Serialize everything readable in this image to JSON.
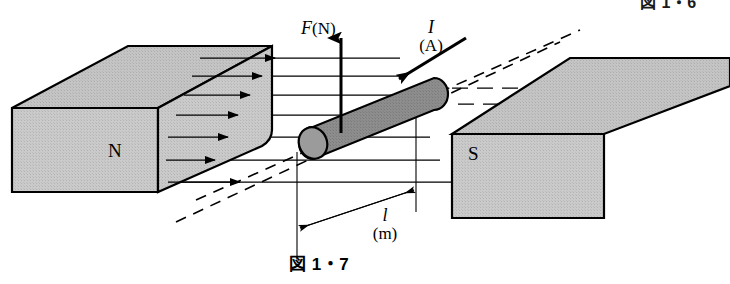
{
  "figure": {
    "caption": "図 1・7",
    "caption_above": "図 1・6",
    "background_color": "#ffffff",
    "ink_color": "#000000",
    "magnet_fill": "#c9c9c9",
    "magnet_top_fill": "#c4c4c4",
    "rod_fill": "#8a8a8a",
    "rod_cap_fill": "#9a9a9a"
  },
  "labels": {
    "north_pole": "N",
    "south_pole": "S",
    "force_symbol": "F",
    "force_unit": "(N)",
    "current_symbol": "I",
    "current_unit": "(A)",
    "length_symbol": "l",
    "length_unit": "(m)"
  },
  "elements": {
    "north_block_name": "north-pole-magnet",
    "south_block_name": "south-pole-magnet",
    "rod_name": "current-carrying-conductor",
    "force_arrow_name": "force-arrow",
    "current_arrow_name": "current-arrow",
    "length_dimension_name": "length-dimension-arrow",
    "field_lines_name": "magnetic-field-lines",
    "dashed_guides_name": "dashed-guide-lines"
  }
}
